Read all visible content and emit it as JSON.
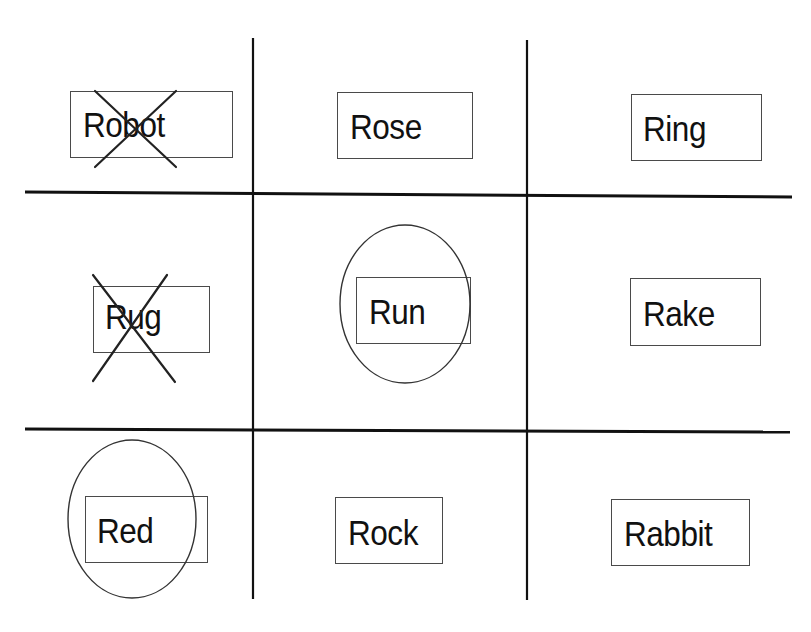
{
  "board": {
    "description": "3x3 word grid with crossed-out and circled words",
    "line_color": "#111111",
    "mark_color": "#222222",
    "cells": [
      {
        "row": 0,
        "col": 0,
        "word": "Robot",
        "mark": "x",
        "box": {
          "x": 70,
          "y": 91,
          "w": 163,
          "h": 67
        },
        "text_x": 83,
        "text_y": 105
      },
      {
        "row": 0,
        "col": 1,
        "word": "Rose",
        "mark": "none",
        "box": {
          "x": 337,
          "y": 92,
          "w": 136,
          "h": 67
        },
        "text_x": 350,
        "text_y": 107
      },
      {
        "row": 0,
        "col": 2,
        "word": "Ring",
        "mark": "none",
        "box": {
          "x": 631,
          "y": 94,
          "w": 131,
          "h": 67
        },
        "text_x": 643,
        "text_y": 109
      },
      {
        "row": 1,
        "col": 0,
        "word": "Rug",
        "mark": "x",
        "box": {
          "x": 93,
          "y": 286,
          "w": 117,
          "h": 67
        },
        "text_x": 105,
        "text_y": 297
      },
      {
        "row": 1,
        "col": 1,
        "word": "Run",
        "mark": "circle",
        "box": {
          "x": 356,
          "y": 277,
          "w": 115,
          "h": 67
        },
        "text_x": 369,
        "text_y": 293
      },
      {
        "row": 1,
        "col": 2,
        "word": "Rake",
        "mark": "none",
        "box": {
          "x": 630,
          "y": 278,
          "w": 131,
          "h": 68
        },
        "text_x": 643,
        "text_y": 296
      },
      {
        "row": 2,
        "col": 0,
        "word": "Red",
        "mark": "circle",
        "box": {
          "x": 85,
          "y": 496,
          "w": 123,
          "h": 67
        },
        "text_x": 97,
        "text_y": 512
      },
      {
        "row": 2,
        "col": 1,
        "word": "Rock",
        "mark": "none",
        "box": {
          "x": 335,
          "y": 497,
          "w": 108,
          "h": 67
        },
        "text_x": 348,
        "text_y": 514
      },
      {
        "row": 2,
        "col": 2,
        "word": "Rabbit",
        "mark": "none",
        "box": {
          "x": 611,
          "y": 499,
          "w": 139,
          "h": 67
        },
        "text_x": 624,
        "text_y": 515
      }
    ],
    "summary": {
      "crossed_out": [
        "Robot",
        "Rug"
      ],
      "circled": [
        "Run",
        "Red"
      ]
    }
  }
}
